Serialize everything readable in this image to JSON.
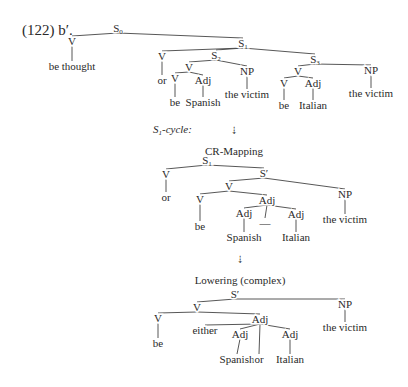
{
  "example_label": "(122) b′.",
  "trees": [
    {
      "id": "tree1",
      "nodes": [
        {
          "id": "t1_S0",
          "label": "S",
          "sub": "0",
          "x": 118,
          "y": 32
        },
        {
          "id": "t1_V0",
          "label": "V",
          "x": 72,
          "y": 45
        },
        {
          "id": "t1_w_bethought",
          "label": "be thought",
          "x": 72,
          "y": 70,
          "leaf": true
        },
        {
          "id": "t1_S1",
          "label": "S",
          "sub": "1",
          "x": 243,
          "y": 47
        },
        {
          "id": "t1_Vor",
          "label": "V",
          "x": 162,
          "y": 60
        },
        {
          "id": "t1_w_or",
          "label": "or",
          "x": 162,
          "y": 84,
          "leaf": true
        },
        {
          "id": "t1_S2",
          "label": "S",
          "sub": "2",
          "x": 216,
          "y": 59
        },
        {
          "id": "t1_S2_V",
          "label": "V",
          "x": 189,
          "y": 71
        },
        {
          "id": "t1_S2_Vbe",
          "label": "V",
          "x": 175,
          "y": 82
        },
        {
          "id": "t1_w_be1",
          "label": "be",
          "x": 175,
          "y": 106,
          "leaf": true
        },
        {
          "id": "t1_S2_Adj",
          "label": "Adj",
          "x": 203,
          "y": 84
        },
        {
          "id": "t1_w_spanish",
          "label": "Spanish",
          "x": 203,
          "y": 106,
          "leaf": true
        },
        {
          "id": "t1_S2_NP",
          "label": "NP",
          "x": 247,
          "y": 75
        },
        {
          "id": "t1_w_victim1",
          "label": "the victim",
          "x": 247,
          "y": 98,
          "leaf": true
        },
        {
          "id": "t1_S3",
          "label": "S",
          "sub": "3",
          "x": 315,
          "y": 63
        },
        {
          "id": "t1_S3_V",
          "label": "V",
          "x": 298,
          "y": 75
        },
        {
          "id": "t1_S3_Vbe",
          "label": "V",
          "x": 284,
          "y": 87
        },
        {
          "id": "t1_w_be2",
          "label": "be",
          "x": 284,
          "y": 109,
          "leaf": true
        },
        {
          "id": "t1_S3_Adj",
          "label": "Adj",
          "x": 313,
          "y": 87
        },
        {
          "id": "t1_w_italian",
          "label": "Italian",
          "x": 313,
          "y": 109,
          "leaf": true
        },
        {
          "id": "t1_S3_NP",
          "label": "NP",
          "x": 371,
          "y": 74
        },
        {
          "id": "t1_w_victim2",
          "label": "the victim",
          "x": 371,
          "y": 97,
          "leaf": true
        }
      ],
      "edges": [
        [
          "t1_S0",
          "t1_V0"
        ],
        [
          "t1_V0",
          "t1_w_bethought"
        ],
        [
          "t1_S0",
          "t1_S1"
        ],
        [
          "t1_S1",
          "t1_Vor"
        ],
        [
          "t1_Vor",
          "t1_w_or"
        ],
        [
          "t1_S1",
          "t1_S2"
        ],
        [
          "t1_S1",
          "t1_S3"
        ],
        [
          "t1_S2",
          "t1_S2_V"
        ],
        [
          "t1_S2_V",
          "t1_S2_Vbe"
        ],
        [
          "t1_S2_Vbe",
          "t1_w_be1"
        ],
        [
          "t1_S2_V",
          "t1_S2_Adj"
        ],
        [
          "t1_S2_Adj",
          "t1_w_spanish"
        ],
        [
          "t1_S2",
          "t1_S2_NP"
        ],
        [
          "t1_S2_NP",
          "t1_w_victim1"
        ],
        [
          "t1_S3",
          "t1_S3_V"
        ],
        [
          "t1_S3_V",
          "t1_S3_Vbe"
        ],
        [
          "t1_S3_Vbe",
          "t1_w_be2"
        ],
        [
          "t1_S3_V",
          "t1_S3_Adj"
        ],
        [
          "t1_S3_Adj",
          "t1_w_italian"
        ],
        [
          "t1_S3",
          "t1_S3_NP"
        ],
        [
          "t1_S3_NP",
          "t1_w_victim2"
        ]
      ]
    },
    {
      "id": "tree2",
      "nodes": [
        {
          "id": "t2_S1",
          "label": "S",
          "sub": "1",
          "x": 207,
          "y": 164
        },
        {
          "id": "t2_Vor",
          "label": "V",
          "x": 166,
          "y": 178
        },
        {
          "id": "t2_w_or",
          "label": "or",
          "x": 166,
          "y": 201,
          "leaf": true
        },
        {
          "id": "t2_Sp",
          "label": "S′",
          "x": 264,
          "y": 177
        },
        {
          "id": "t2_V",
          "label": "V",
          "x": 229,
          "y": 190
        },
        {
          "id": "t2_Vbe",
          "label": "V",
          "x": 200,
          "y": 203
        },
        {
          "id": "t2_w_be",
          "label": "be",
          "x": 200,
          "y": 230,
          "leaf": true
        },
        {
          "id": "t2_Adj",
          "label": "Adj",
          "x": 267,
          "y": 204
        },
        {
          "id": "t2_Adj1",
          "label": "Adj",
          "x": 244,
          "y": 217
        },
        {
          "id": "t2_w_spanish",
          "label": "Spanish",
          "x": 244,
          "y": 241,
          "leaf": true
        },
        {
          "id": "t2_dash",
          "label": "—",
          "x": 265,
          "y": 227,
          "leaf": true
        },
        {
          "id": "t2_Adj2",
          "label": "Adj",
          "x": 296,
          "y": 218
        },
        {
          "id": "t2_w_italian",
          "label": "Italian",
          "x": 296,
          "y": 241,
          "leaf": true
        },
        {
          "id": "t2_NP",
          "label": "NP",
          "x": 345,
          "y": 198
        },
        {
          "id": "t2_w_victim",
          "label": "the victim",
          "x": 345,
          "y": 223,
          "leaf": true
        }
      ],
      "edges": [
        [
          "t2_S1",
          "t2_Vor"
        ],
        [
          "t2_Vor",
          "t2_w_or"
        ],
        [
          "t2_S1",
          "t2_Sp"
        ],
        [
          "t2_Sp",
          "t2_V"
        ],
        [
          "t2_V",
          "t2_Vbe"
        ],
        [
          "t2_Vbe",
          "t2_w_be"
        ],
        [
          "t2_V",
          "t2_Adj"
        ],
        [
          "t2_Adj",
          "t2_Adj1"
        ],
        [
          "t2_Adj1",
          "t2_w_spanish"
        ],
        [
          "t2_Adj",
          "t2_dash"
        ],
        [
          "t2_Adj",
          "t2_Adj2"
        ],
        [
          "t2_Adj2",
          "t2_w_italian"
        ],
        [
          "t2_Sp",
          "t2_NP"
        ],
        [
          "t2_NP",
          "t2_w_victim"
        ]
      ]
    },
    {
      "id": "tree3",
      "nodes": [
        {
          "id": "t3_Sp",
          "label": "S′",
          "x": 235,
          "y": 298
        },
        {
          "id": "t3_V",
          "label": "V",
          "x": 197,
          "y": 311
        },
        {
          "id": "t3_Vbe",
          "label": "V",
          "x": 158,
          "y": 322
        },
        {
          "id": "t3_w_be",
          "label": "be",
          "x": 158,
          "y": 347,
          "leaf": true
        },
        {
          "id": "t3_Adj",
          "label": "Adj",
          "x": 260,
          "y": 323
        },
        {
          "id": "t3_w_either",
          "label": "either",
          "x": 205,
          "y": 334,
          "leaf": true
        },
        {
          "id": "t3_Adj1",
          "label": "Adj",
          "x": 240,
          "y": 338
        },
        {
          "id": "t3_w_spanish",
          "label": "Spanish",
          "x": 237,
          "y": 363,
          "leaf": true
        },
        {
          "id": "t3_w_or",
          "label": "or",
          "x": 259,
          "y": 363,
          "leaf": true
        },
        {
          "id": "t3_Adj2",
          "label": "Adj",
          "x": 290,
          "y": 338
        },
        {
          "id": "t3_w_italian",
          "label": "Italian",
          "x": 290,
          "y": 363,
          "leaf": true
        },
        {
          "id": "t3_NP",
          "label": "NP",
          "x": 345,
          "y": 308
        },
        {
          "id": "t3_w_victim",
          "label": "the victim",
          "x": 345,
          "y": 331,
          "leaf": true
        }
      ],
      "edges": [
        [
          "t3_Sp",
          "t3_V"
        ],
        [
          "t3_V",
          "t3_Vbe"
        ],
        [
          "t3_Vbe",
          "t3_w_be"
        ],
        [
          "t3_V",
          "t3_Adj"
        ],
        [
          "t3_Adj",
          "t3_w_either"
        ],
        [
          "t3_Adj",
          "t3_Adj1"
        ],
        [
          "t3_Adj1",
          "t3_w_spanish"
        ],
        [
          "t3_Adj",
          "t3_w_or"
        ],
        [
          "t3_Adj",
          "t3_Adj2"
        ],
        [
          "t3_Adj2",
          "t3_w_italian"
        ],
        [
          "t3_Sp",
          "t3_NP"
        ],
        [
          "t3_NP",
          "t3_w_victim"
        ]
      ]
    }
  ],
  "annotations": {
    "cycle_label": "S",
    "cycle_sub": "1",
    "cycle_suffix": "-cycle:",
    "arrow1": "⇣",
    "step1": "CR-Mapping",
    "arrow2": "⇣",
    "step2": "Lowering (complex)"
  }
}
